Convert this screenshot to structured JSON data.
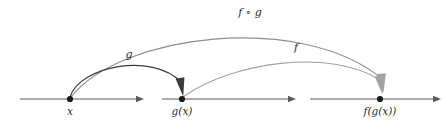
{
  "figure": {
    "kind": "function-composition-diagram",
    "background_color": "#ffffff",
    "ink_color_dark": "#3b3b3b",
    "ink_color_mid": "#8f8f8f",
    "ink_color_light": "#a2a2a2",
    "axis_color": "#5a5a5a"
  },
  "points": [
    {
      "id": "x",
      "label": "x",
      "cx": 70,
      "cy": 99
    },
    {
      "id": "gx",
      "label": "g(x)",
      "cx": 182,
      "cy": 99
    },
    {
      "id": "fgx",
      "label": "f(g(x))",
      "cx": 380,
      "cy": 99
    }
  ],
  "axes": [
    {
      "id": "axis-domain",
      "x1": 20,
      "x2": 143,
      "y": 99
    },
    {
      "id": "axis-intermediate",
      "x1": 162,
      "x2": 295,
      "y": 99
    },
    {
      "id": "axis-codomain",
      "x1": 310,
      "x2": 440,
      "y": 99
    }
  ],
  "arcs": [
    {
      "id": "arc-g",
      "label": "g",
      "from": "x",
      "to": "gx",
      "label_x": 129,
      "label_y": 58,
      "tone": "dark"
    },
    {
      "id": "arc-f",
      "label": "f",
      "from": "gx",
      "to": "fgx",
      "label_x": 296,
      "label_y": 51,
      "tone": "light"
    },
    {
      "id": "arc-f-compose-g",
      "label": "f ∘ g",
      "from": "x",
      "to": "fgx",
      "label_x": 250,
      "label_y": 16,
      "tone": "mid"
    }
  ],
  "labels": {
    "x": "x",
    "gx": "g(x)",
    "fgx": "f(g(x))",
    "g": "g",
    "f": "f",
    "fog": "f ∘ g"
  }
}
